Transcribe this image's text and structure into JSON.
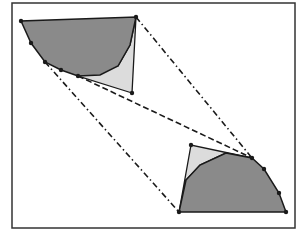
{
  "figure": {
    "width": 304,
    "height": 230,
    "frame": {
      "x": 12,
      "y": 3,
      "w": 283,
      "h": 225,
      "stroke": "#333333"
    },
    "colors": {
      "dark_fill": "#8a8a8a",
      "light_fill": "#dcdcdc",
      "stroke": "#1a1a1a",
      "background": "#ffffff"
    },
    "upper_shape": {
      "region": [
        [
          21,
          21
        ],
        [
          136,
          17
        ],
        [
          132,
          93
        ],
        [
          78,
          76
        ]
      ],
      "curve": [
        [
          21,
          21
        ],
        [
          31,
          43
        ],
        [
          45,
          62
        ],
        [
          61,
          70
        ],
        [
          78,
          76
        ],
        [
          100,
          75
        ],
        [
          118,
          66
        ],
        [
          130,
          45
        ],
        [
          136,
          17
        ]
      ],
      "triangle": [
        [
          78,
          76
        ],
        [
          118,
          66
        ],
        [
          130,
          45
        ],
        [
          136,
          17
        ],
        [
          132,
          93
        ]
      ],
      "vertices": [
        [
          21,
          21
        ],
        [
          31,
          43
        ],
        [
          45,
          62
        ],
        [
          61,
          70
        ],
        [
          78,
          76
        ],
        [
          136,
          17
        ],
        [
          132,
          93
        ]
      ]
    },
    "lower_shape": {
      "curve": [
        [
          179,
          212
        ],
        [
          186,
          180
        ],
        [
          200,
          165
        ],
        [
          226,
          153
        ],
        [
          252,
          158
        ],
        [
          264,
          169
        ],
        [
          279,
          193
        ],
        [
          286,
          212
        ]
      ],
      "triangle": [
        [
          179,
          212
        ],
        [
          186,
          180
        ],
        [
          200,
          165
        ],
        [
          226,
          153
        ],
        [
          252,
          158
        ],
        [
          191,
          145
        ]
      ],
      "vertices": [
        [
          179,
          212
        ],
        [
          191,
          145
        ],
        [
          252,
          158
        ],
        [
          264,
          169
        ],
        [
          279,
          193
        ],
        [
          286,
          212
        ]
      ]
    },
    "connectors": [
      {
        "from": [
          136,
          17
        ],
        "to": [
          252,
          158
        ],
        "style": "dash-dot"
      },
      {
        "from": [
          45,
          62
        ],
        "to": [
          179,
          212
        ],
        "style": "dash-dot"
      },
      {
        "from": [
          78,
          76
        ],
        "to": [
          252,
          158
        ],
        "style": "dashed"
      }
    ]
  }
}
